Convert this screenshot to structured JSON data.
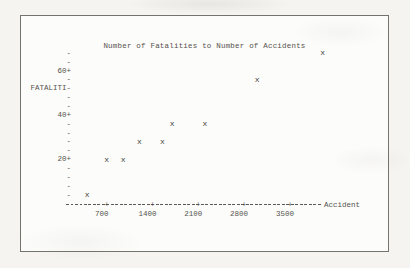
{
  "page": {
    "background_color": "#f5f4f1",
    "paper_color": "#fcfcfa",
    "border_color": "#76736f",
    "text_color": "#55524e"
  },
  "chart_data": {
    "type": "scatter",
    "title": "Number of Fatalities to Number of Accidents",
    "xlabel": "Accident",
    "ylabel": "FATALITI-",
    "marker_glyph": "x",
    "points": [
      {
        "x": 400,
        "y": 4
      },
      {
        "x": 700,
        "y": 20
      },
      {
        "x": 950,
        "y": 20
      },
      {
        "x": 1200,
        "y": 28
      },
      {
        "x": 1550,
        "y": 28
      },
      {
        "x": 1700,
        "y": 36
      },
      {
        "x": 2200,
        "y": 36
      },
      {
        "x": 3000,
        "y": 56
      },
      {
        "x": 4000,
        "y": 68
      }
    ],
    "x_ticks": [
      700,
      1400,
      2100,
      2800,
      3500
    ],
    "y_ticks": [
      20,
      40,
      60
    ],
    "y_tick_suffix": "+",
    "y_minor_step": 4,
    "y_axis_top_value": 68,
    "y_axis_bottom_value": 4,
    "ylabel_row_value": 52,
    "xlim": [
      60,
      4450
    ],
    "ylim": [
      0,
      70
    ],
    "grid": false,
    "legend": null,
    "axis_style": "typewriter-dashed"
  }
}
